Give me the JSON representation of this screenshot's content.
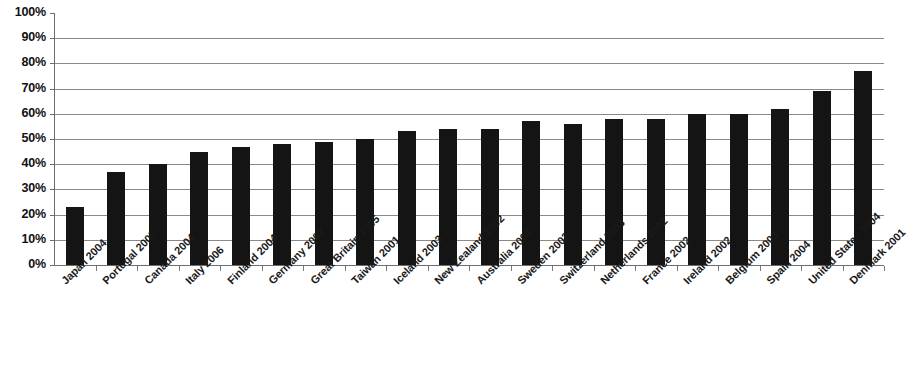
{
  "chart_data": {
    "type": "bar",
    "title": "",
    "subtitle": "",
    "xlabel": "",
    "ylabel": "",
    "ylim": [
      0,
      100
    ],
    "y_tick_labels": [
      "100%",
      "90%",
      "80%",
      "70%",
      "60%",
      "50%",
      "40%",
      "30%",
      "20%",
      "10%",
      "0%"
    ],
    "y_tick_values": [
      100,
      90,
      80,
      70,
      60,
      50,
      40,
      30,
      20,
      10,
      0
    ],
    "grid": true,
    "legend": "none",
    "value_suffix": "%",
    "bar_color": "#141414",
    "gridline_color": "#8a8a8a",
    "axis_color": "#6e6e6e",
    "categories": [
      "Japan 2004",
      "Portugal 2005",
      "Canada 2004",
      "Italy 2006",
      "Finland 2004",
      "Germany 2002",
      "Great Britain 2005",
      "Taiwan 2001",
      "Iceland 2003",
      "New Zealand 2002",
      "Australia 2004",
      "Sweden 2002",
      "Switzerland 2003",
      "Netherlands 2002",
      "France 2002",
      "Ireland 2002",
      "Belgium 2003",
      "Spain 2004",
      "United States 2004",
      "Denmark 2001"
    ],
    "values": [
      23,
      37,
      40,
      45,
      47,
      48,
      49,
      50,
      53,
      54,
      54,
      57,
      56,
      58,
      58,
      60,
      60,
      62,
      69,
      77
    ]
  }
}
